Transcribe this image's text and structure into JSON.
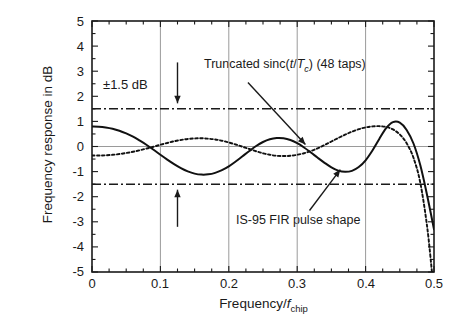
{
  "chart_data": {
    "type": "line",
    "title": "",
    "xlabel": "Frequency/f_chip",
    "ylabel": "Frequency response in dB",
    "xlim": [
      0,
      0.5
    ],
    "ylim": [
      -5,
      5
    ],
    "grid": true,
    "grid_x": [
      0.1,
      0.2,
      0.3,
      0.4
    ],
    "grid_y": [
      0
    ],
    "xticks": [
      "0",
      "0.1",
      "0.2",
      "0.3",
      "0.4",
      "0.5"
    ],
    "xtick_values": [
      0,
      0.1,
      0.2,
      0.3,
      0.4,
      0.5
    ],
    "yticks": [
      "5",
      "4",
      "3",
      "2",
      "1",
      "0",
      "-1",
      "-2",
      "-3",
      "-4",
      "-5"
    ],
    "ytick_values": [
      5,
      4,
      3,
      2,
      1,
      0,
      -1,
      -2,
      -3,
      -4,
      -5
    ],
    "xminor_step": 0.025,
    "yminor_step": 0.5,
    "legend": "annotations",
    "series": [
      {
        "name": "IS-95 FIR pulse shape",
        "style": "solid",
        "color": "#111111",
        "x": [
          0.0,
          0.01,
          0.02,
          0.03,
          0.04,
          0.05,
          0.06,
          0.07,
          0.08,
          0.09,
          0.1,
          0.11,
          0.12,
          0.13,
          0.14,
          0.15,
          0.16,
          0.17,
          0.18,
          0.19,
          0.2,
          0.21,
          0.22,
          0.23,
          0.24,
          0.25,
          0.26,
          0.27,
          0.28,
          0.29,
          0.3,
          0.31,
          0.32,
          0.33,
          0.34,
          0.35,
          0.36,
          0.37,
          0.38,
          0.39,
          0.4,
          0.41,
          0.42,
          0.43,
          0.44,
          0.45,
          0.46,
          0.47,
          0.48,
          0.49,
          0.5
        ],
        "y": [
          0.8,
          0.79,
          0.76,
          0.71,
          0.63,
          0.52,
          0.39,
          0.23,
          0.06,
          -0.13,
          -0.33,
          -0.52,
          -0.7,
          -0.86,
          -0.99,
          -1.08,
          -1.12,
          -1.11,
          -1.05,
          -0.94,
          -0.79,
          -0.6,
          -0.39,
          -0.18,
          0.02,
          0.18,
          0.29,
          0.34,
          0.33,
          0.26,
          0.13,
          -0.04,
          -0.24,
          -0.45,
          -0.65,
          -0.83,
          -0.96,
          -1.01,
          -0.97,
          -0.82,
          -0.55,
          -0.16,
          0.3,
          0.73,
          0.97,
          0.95,
          0.66,
          0.12,
          -0.75,
          -1.95,
          -3.3
        ]
      },
      {
        "name": "Truncated sinc(t/Tc) (48 taps)",
        "style": "dotted",
        "color": "#111111",
        "x": [
          0.0,
          0.01,
          0.02,
          0.03,
          0.04,
          0.05,
          0.06,
          0.07,
          0.08,
          0.09,
          0.1,
          0.11,
          0.12,
          0.13,
          0.14,
          0.15,
          0.16,
          0.17,
          0.18,
          0.19,
          0.2,
          0.21,
          0.22,
          0.23,
          0.24,
          0.25,
          0.26,
          0.27,
          0.28,
          0.29,
          0.3,
          0.31,
          0.32,
          0.33,
          0.34,
          0.35,
          0.36,
          0.37,
          0.38,
          0.39,
          0.4,
          0.41,
          0.42,
          0.43,
          0.44,
          0.45,
          0.46,
          0.47,
          0.48,
          0.49,
          0.497
        ],
        "y": [
          -0.36,
          -0.36,
          -0.35,
          -0.33,
          -0.3,
          -0.26,
          -0.21,
          -0.15,
          -0.08,
          -0.01,
          0.07,
          0.14,
          0.21,
          0.26,
          0.3,
          0.32,
          0.33,
          0.31,
          0.28,
          0.23,
          0.16,
          0.08,
          -0.01,
          -0.1,
          -0.19,
          -0.27,
          -0.33,
          -0.37,
          -0.38,
          -0.37,
          -0.33,
          -0.27,
          -0.18,
          -0.07,
          0.06,
          0.2,
          0.34,
          0.47,
          0.59,
          0.69,
          0.76,
          0.8,
          0.81,
          0.78,
          0.68,
          0.48,
          0.13,
          -0.45,
          -1.45,
          -3.2,
          -5.0
        ]
      }
    ],
    "reference_lines": [
      {
        "label": "+1.5 dB",
        "value": 1.5,
        "style": "dashdot"
      },
      {
        "label": "-1.5 dB",
        "value": -1.5,
        "style": "dashdot"
      }
    ],
    "annotations": [
      {
        "name": "limit-label",
        "text": "±1.5 dB",
        "x": 0.018,
        "y": 2.1
      },
      {
        "name": "sinc-label",
        "text": "Truncated sinc(t/Tc) (48 taps)",
        "x": 0.175,
        "y": 3.1
      },
      {
        "name": "is95-label",
        "text": "IS-95 FIR pulse shape",
        "x": 0.245,
        "y": -2.85
      },
      {
        "name": "upper-limit-arrow",
        "text": "arrow-down",
        "x": 0.125,
        "y": 3.0
      },
      {
        "name": "lower-limit-arrow",
        "text": "arrow-up",
        "x": 0.125,
        "y": -2.9
      }
    ]
  },
  "labels": {
    "y_axis": "Frequency response in dB",
    "x_axis_prefix": "Frequency/",
    "x_axis_var": "f",
    "x_axis_sub": "chip",
    "limit": "±1.5 dB",
    "sinc_pre": "Truncated sinc(",
    "sinc_var_t": "t",
    "sinc_slash": "/",
    "sinc_var_T": "T",
    "sinc_sub_c": "c",
    "sinc_post": ") (48 taps)",
    "is95": "IS-95 FIR pulse shape"
  },
  "ticks": {
    "y": [
      "5",
      "4",
      "3",
      "2",
      "1",
      "0",
      "-1",
      "-2",
      "-3",
      "-4",
      "-5"
    ],
    "x": [
      "0",
      "0.1",
      "0.2",
      "0.3",
      "0.4",
      "0.5"
    ]
  },
  "colors": {
    "axis": "#1a1a1a",
    "grid": "#9a9a9a",
    "curve": "#111111",
    "background": "#ffffff"
  }
}
